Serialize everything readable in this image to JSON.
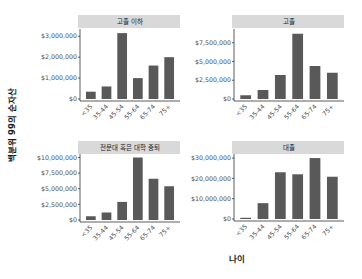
{
  "chart_data": {
    "type": "bar",
    "layout": "facet_wrap 2x2",
    "xlabel": "나이",
    "ylabel": "백분위 99의 순자산",
    "categories": [
      "<35",
      "35-44",
      "45-54",
      "55-64",
      "65-74",
      "75+"
    ],
    "grid": false,
    "bar_color": "#595959",
    "strip_color": "#d9d9d9",
    "panels": [
      {
        "title": "고졸 이하",
        "values": [
          350000,
          600000,
          3150000,
          1000000,
          1600000,
          2000000
        ],
        "ylim": [
          0,
          3300000
        ],
        "yticks": [
          0,
          1000000,
          2000000,
          3000000
        ],
        "ytick_labels": [
          "$0",
          "$1,000,000",
          "$2,000,000",
          "$3,000,000"
        ]
      },
      {
        "title": "고졸",
        "values": [
          500000,
          1200000,
          3200000,
          8700000,
          4400000,
          3500000
        ],
        "ylim": [
          0,
          9200000
        ],
        "yticks": [
          0,
          2500000,
          5000000,
          7500000
        ],
        "ytick_labels": [
          "$0",
          "$2,500,000",
          "$5,000,000",
          "$7,500,000"
        ]
      },
      {
        "title": "전문대 혹은 대학 중퇴",
        "values": [
          600000,
          1200000,
          2900000,
          10000000,
          6600000,
          5400000
        ],
        "ylim": [
          0,
          10400000
        ],
        "yticks": [
          0,
          2500000,
          5000000,
          7500000,
          10000000
        ],
        "ytick_labels": [
          "$0",
          "$2,500,000",
          "$5,000,000",
          "$7,500,000",
          "$10,000,000"
        ]
      },
      {
        "title": "대졸",
        "values": [
          600000,
          7800000,
          23000000,
          22000000,
          30000000,
          20800000
        ],
        "ylim": [
          0,
          31500000
        ],
        "yticks": [
          0,
          10000000,
          20000000,
          30000000
        ],
        "ytick_labels": [
          "$0",
          "$10,000,000",
          "$20,000,000",
          "$30,000,000"
        ]
      }
    ]
  }
}
